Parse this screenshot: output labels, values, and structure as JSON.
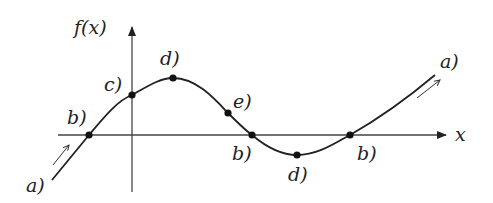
{
  "diagram": {
    "y_axis_label": "f(x)",
    "x_axis_label": "x",
    "points": [
      {
        "id": "b_left",
        "label": "b)",
        "x": 89,
        "y": 135
      },
      {
        "id": "c",
        "label": "c)",
        "x": 132,
        "y": 95
      },
      {
        "id": "d_max",
        "label": "d)",
        "x": 173,
        "y": 78
      },
      {
        "id": "e",
        "label": "e)",
        "x": 228,
        "y": 113
      },
      {
        "id": "b_mid",
        "label": "b)",
        "x": 252,
        "y": 135
      },
      {
        "id": "d_min",
        "label": "d)",
        "x": 297,
        "y": 155
      },
      {
        "id": "b_right",
        "label": "b)",
        "x": 350,
        "y": 135
      }
    ],
    "end_labels": {
      "left": "a)",
      "right": "a)"
    },
    "colors": {
      "line": "#222222",
      "axis": "#444444",
      "background": "#ffffff"
    }
  }
}
